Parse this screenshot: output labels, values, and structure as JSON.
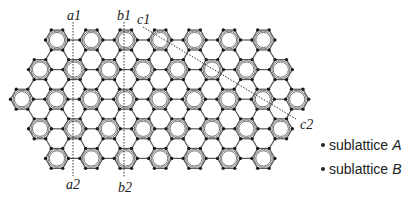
{
  "figure": {
    "type": "kekule-honeycomb-lattice",
    "lattice": {
      "bond_length_px": 11.5,
      "row_spacing_px": 29.6,
      "col_spacing_px": 34.4,
      "first_row_y": 40,
      "rows": [
        {
          "start_x": 57,
          "count": 7
        },
        {
          "start_x": 40,
          "count": 8
        },
        {
          "start_x": 22,
          "count": 9
        },
        {
          "start_x": 40,
          "count": 8
        },
        {
          "start_x": 57,
          "count": 7
        }
      ],
      "atom_color": "#1a1a1a",
      "bond_color": "#555555",
      "ring_color": "#777777"
    },
    "cuts": [
      {
        "id": "a",
        "start_label": "a1",
        "end_label": "a2",
        "x1": 73,
        "y1": 22,
        "x2": 73,
        "y2": 176
      },
      {
        "id": "b",
        "start_label": "b1",
        "end_label": "b2",
        "x1": 124,
        "y1": 22,
        "x2": 124,
        "y2": 178
      },
      {
        "id": "c",
        "start_label": "c1",
        "end_label": "c2",
        "x1": 143,
        "y1": 27,
        "x2": 296,
        "y2": 119
      }
    ]
  },
  "labels": {
    "a1": "a1",
    "a2": "a2",
    "b1": "b1",
    "b2": "b2",
    "c1": "c1",
    "c2": "c2"
  },
  "legend": {
    "items": [
      {
        "prefix": "sublattice",
        "name": "A"
      },
      {
        "prefix": "sublattice",
        "name": "B"
      }
    ]
  }
}
